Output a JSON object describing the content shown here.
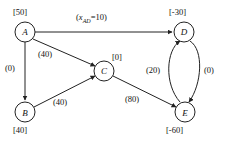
{
  "diagram": {
    "background_color": "#ffffff",
    "stroke_color": "#222222",
    "nodes": [
      {
        "id": "A",
        "letter": "A",
        "supply": "[50]",
        "cx": 25,
        "cy": 32,
        "r": 10,
        "supply_x": 13,
        "supply_y": 8
      },
      {
        "id": "B",
        "letter": "B",
        "supply": "[40]",
        "cx": 25,
        "cy": 112,
        "r": 10,
        "supply_x": 13,
        "supply_y": 126
      },
      {
        "id": "C",
        "letter": "C",
        "supply": "[0]",
        "cx": 104,
        "cy": 71,
        "r": 10,
        "supply_x": 112,
        "supply_y": 53
      },
      {
        "id": "D",
        "letter": "D",
        "supply": "[-30]",
        "cx": 184,
        "cy": 32,
        "r": 10,
        "supply_x": 170,
        "supply_y": 8
      },
      {
        "id": "E",
        "letter": "E",
        "supply": "[-60]",
        "cx": 185,
        "cy": 112,
        "r": 10,
        "supply_x": 169,
        "supply_y": 126
      }
    ],
    "edges": [
      {
        "id": "A-D",
        "from": "A",
        "to": "D",
        "label": "(x_AD=10)",
        "label_prefix": "(",
        "label_var": "x",
        "label_sub": "AD",
        "label_suffix": "=10)",
        "label_x": 76,
        "label_y": 13,
        "kind": "straight"
      },
      {
        "id": "A-B",
        "from": "A",
        "to": "B",
        "label": "(0)",
        "label_x": 5,
        "label_y": 64,
        "kind": "straight"
      },
      {
        "id": "A-C",
        "from": "A",
        "to": "C",
        "label": "(40)",
        "label_x": 38,
        "label_y": 50,
        "kind": "straight"
      },
      {
        "id": "B-C",
        "from": "B",
        "to": "C",
        "label": "(40)",
        "label_x": 53,
        "label_y": 98,
        "kind": "straight"
      },
      {
        "id": "C-E",
        "from": "C",
        "to": "E",
        "label": "(80)",
        "label_x": 125,
        "label_y": 95,
        "kind": "straight"
      },
      {
        "id": "E-D",
        "from": "E",
        "to": "D",
        "label": "(20)",
        "label_x": 146,
        "label_y": 66,
        "kind": "curve-left"
      },
      {
        "id": "D-E",
        "from": "D",
        "to": "E",
        "label": "(0)",
        "label_x": 204,
        "label_y": 66,
        "kind": "curve-right"
      }
    ]
  }
}
